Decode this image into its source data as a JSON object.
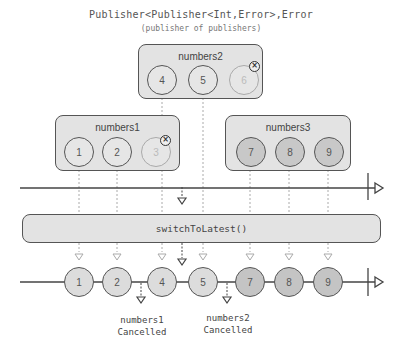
{
  "title": "Publisher<Publisher<Int,Error>,Error",
  "subtitle": "(publisher of publishers)",
  "publishers": [
    {
      "name": "numbers1",
      "values": [
        "1",
        "2",
        "3"
      ],
      "cancelled_value": "3"
    },
    {
      "name": "numbers2",
      "values": [
        "4",
        "5",
        "6"
      ],
      "cancelled_value": "6"
    },
    {
      "name": "numbers3",
      "values": [
        "7",
        "8",
        "9"
      ]
    }
  ],
  "operator": "switchToLatest()",
  "output": [
    "1",
    "2",
    "4",
    "5",
    "7",
    "8",
    "9"
  ],
  "notes": [
    {
      "line1": "numbers1",
      "line2": "Cancelled"
    },
    {
      "line1": "numbers2",
      "line2": "Cancelled"
    }
  ],
  "icons": {
    "cancel": "×"
  },
  "colors": {
    "box_fill": "#e3e3e3",
    "stroke": "#555555",
    "dashed": "#999999"
  }
}
